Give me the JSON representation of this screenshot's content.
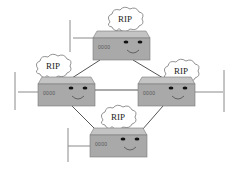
{
  "diagram": {
    "routers": [
      {
        "id": "top",
        "bubble": "RIP",
        "ports": "0000"
      },
      {
        "id": "left",
        "bubble": "RIP",
        "ports": "0000"
      },
      {
        "id": "right",
        "bubble": "RIP",
        "ports": "0000"
      },
      {
        "id": "bottom",
        "bubble": "RIP",
        "ports": "0000"
      }
    ],
    "links": [
      {
        "from": "top",
        "to": "left"
      },
      {
        "from": "top",
        "to": "right"
      },
      {
        "from": "left",
        "to": "right"
      },
      {
        "from": "left",
        "to": "bottom"
      },
      {
        "from": "right",
        "to": "bottom"
      }
    ],
    "lans": [
      "top",
      "left",
      "right",
      "bottom"
    ],
    "colors": {
      "router_front": "#a9a9a9",
      "router_top": "#c4c4c4",
      "line": "#555555",
      "lan_line": "#8a8a8a",
      "cloud_fill": "#ffffff",
      "cloud_stroke": "#777777"
    }
  }
}
